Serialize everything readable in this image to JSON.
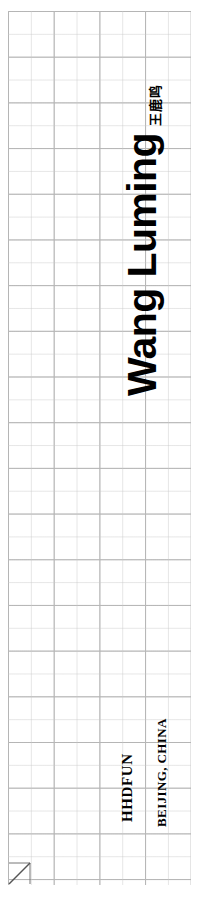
{
  "page": {
    "background_color": "#ffffff",
    "width": 198,
    "height": 904
  },
  "grid": {
    "name": "graph-paper-grid",
    "minor_cell_px": 23,
    "major_cell_px": 46,
    "minor_line_color": "#c8c8c8",
    "major_line_color": "#969696",
    "columns": 8,
    "rows": 38
  },
  "title": {
    "latin_name": "Wang Luming",
    "cjk_name": "王鹿鸣",
    "color": "#000000",
    "orientation": "rotated-90-ccw"
  },
  "footer": {
    "studio": "HHDFUN",
    "location": "BEIJING, CHINA",
    "color": "#000000",
    "orientation": "rotated-90-ccw"
  },
  "marker": {
    "name": "diagonal-arrow-cell",
    "color": "#555555",
    "description": "diagonal line from bottom-left to top-right inside one grid cell"
  }
}
